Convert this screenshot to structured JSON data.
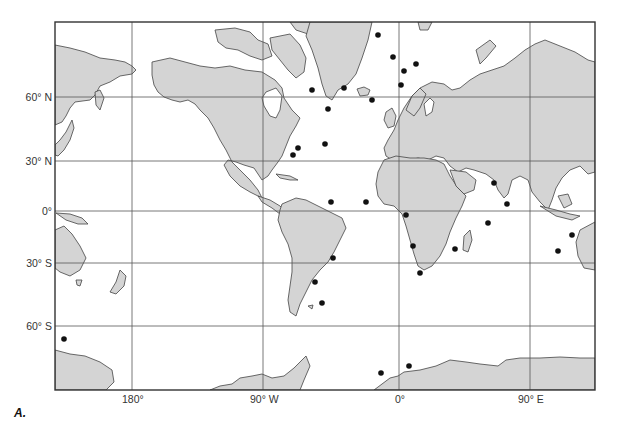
{
  "figure": {
    "caption": "A.",
    "projection": "Mercator world map",
    "colors": {
      "land": "#d4d4d4",
      "ocean": "#ffffff",
      "coast": "#444444",
      "grid": "#555555",
      "dot": "#111111"
    }
  },
  "axes": {
    "lat_labels": [
      "60° N",
      "30° N",
      "0°",
      "30° S",
      "60° S"
    ],
    "lon_labels": [
      "180°",
      "90° W",
      "0°",
      "90° E"
    ]
  },
  "points": [
    {
      "x": 378,
      "y": 35
    },
    {
      "x": 393,
      "y": 57
    },
    {
      "x": 416,
      "y": 64
    },
    {
      "x": 404,
      "y": 71
    },
    {
      "x": 312,
      "y": 90
    },
    {
      "x": 344,
      "y": 88
    },
    {
      "x": 401,
      "y": 85
    },
    {
      "x": 372,
      "y": 100
    },
    {
      "x": 328,
      "y": 109
    },
    {
      "x": 325,
      "y": 144
    },
    {
      "x": 298,
      "y": 148
    },
    {
      "x": 293,
      "y": 155
    },
    {
      "x": 331,
      "y": 202
    },
    {
      "x": 366,
      "y": 202
    },
    {
      "x": 406,
      "y": 215
    },
    {
      "x": 413,
      "y": 246
    },
    {
      "x": 420,
      "y": 273
    },
    {
      "x": 333,
      "y": 258
    },
    {
      "x": 315,
      "y": 282
    },
    {
      "x": 322,
      "y": 303
    },
    {
      "x": 494,
      "y": 183
    },
    {
      "x": 507,
      "y": 204
    },
    {
      "x": 488,
      "y": 223
    },
    {
      "x": 455,
      "y": 249
    },
    {
      "x": 572,
      "y": 235
    },
    {
      "x": 558,
      "y": 251
    },
    {
      "x": 64,
      "y": 339
    },
    {
      "x": 381,
      "y": 373
    },
    {
      "x": 409,
      "y": 366
    }
  ]
}
